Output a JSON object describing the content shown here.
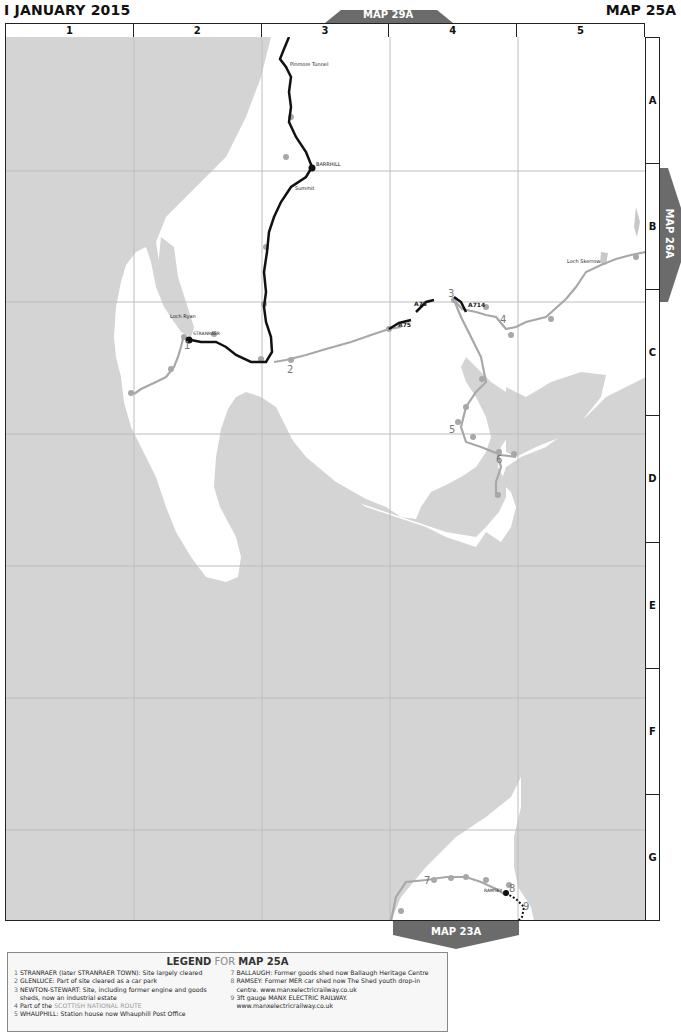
{
  "header": {
    "date": "I JANUARY 2015",
    "map_id": "MAP 25A"
  },
  "grid": {
    "columns": [
      "1",
      "2",
      "3",
      "4",
      "5"
    ],
    "rows": [
      "A",
      "B",
      "C",
      "D",
      "E",
      "F",
      "G"
    ]
  },
  "adjacent_maps": {
    "north": "MAP 29A",
    "east": "MAP 26A",
    "south": "MAP 23A"
  },
  "colors": {
    "land": "#ffffff",
    "sea": "#d4d4d4",
    "open_railway": "#111111",
    "closed_railway": "#a8a8a8",
    "tab": "#6b6b6b",
    "gridline": "#bdbdbd"
  },
  "map_labels": {
    "pinmore_tunnel": "Pinmore Tunnel",
    "barrhill": "BARRHILL",
    "summit": "Summit",
    "loch_ryan": "Loch Ryan",
    "stranraer": "STRANRAER",
    "loch_skerrow": "Loch Skerrow",
    "a75_a": "A75",
    "a75_b": "A75",
    "a714": "A714",
    "ramsey": "RAMSEY"
  },
  "site_numbers": [
    "1",
    "2",
    "3",
    "4",
    "5",
    "6",
    "7",
    "8",
    "9"
  ],
  "legend": {
    "title_bold": "LEGEND",
    "title_for": " FOR ",
    "title_map": "MAP 25A",
    "left_items": [
      {
        "num": "1",
        "text": "STRANRAER (later STRANRAER TOWN): Site largely cleared"
      },
      {
        "num": "2",
        "text": "GLENLUCE: Part of site cleared as a car park"
      },
      {
        "num": "3",
        "text": "NEWTON-STEWART: Site, including former engine and goods"
      },
      {
        "num": "",
        "text": "sheds, now an industrial estate"
      },
      {
        "num": "4",
        "text": "Part of the ",
        "link": "SCOTTISH NATIONAL ROUTE"
      },
      {
        "num": "5",
        "text": "WHAUPHILL: Station house now Whauphill Post Office"
      }
    ],
    "right_items": [
      {
        "num": "7",
        "text": "BALLAUGH: Former goods shed now Ballaugh Heritage Centre"
      },
      {
        "num": "8",
        "text": "RAMSEY: Former MER car shed now The Shed youth drop-in"
      },
      {
        "num": "",
        "text": "centre. www.manxelectricrailway.co.uk"
      },
      {
        "num": "9",
        "text": "3ft gauge MANX ELECTRIC RAILWAY."
      },
      {
        "num": "",
        "text": "www.manxelectricrailway.co.uk"
      }
    ]
  }
}
